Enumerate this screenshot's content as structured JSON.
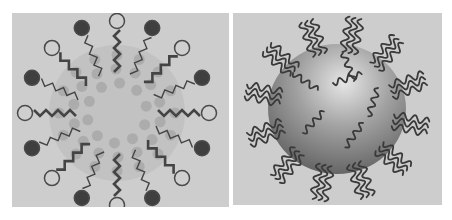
{
  "figure": {
    "panels": [
      {
        "id": "left",
        "depiction": "micelle",
        "background": "#cdcdcd",
        "core_color": "#c2c2c2",
        "core_dot_color": "#acacac",
        "head_dark_color": "#3f3f3f",
        "head_light_color": "#cfcfcf",
        "head_stroke_color": "#4a4a4a",
        "tail_color": "#444444",
        "head_count": 16
      },
      {
        "id": "right",
        "depiction": "polymer-brush-coated nanoparticle",
        "background": "#cdcdcd",
        "sphere_light": "#e6e6e6",
        "sphere_mid": "#9a9a9a",
        "sphere_dark": "#5e5e5e",
        "chain_color": "#3a3a3a",
        "brush_count": 12
      }
    ]
  }
}
